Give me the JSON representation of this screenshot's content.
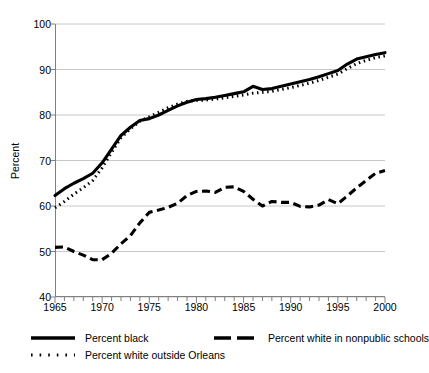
{
  "chart_data": {
    "type": "line",
    "title": "",
    "xlabel": "",
    "ylabel": "Percent",
    "xlim": [
      1965,
      2000
    ],
    "ylim": [
      40,
      100
    ],
    "ytick_labels": [
      "100",
      "90",
      "80",
      "70",
      "60",
      "50",
      "40"
    ],
    "ytick_values": [
      100,
      90,
      80,
      70,
      60,
      50,
      40
    ],
    "xtick_labels": [
      "1965",
      "1970",
      "1975",
      "1980",
      "1985",
      "1990",
      "1995",
      "2000"
    ],
    "xtick_values": [
      1965,
      1970,
      1975,
      1980,
      1985,
      1990,
      1995,
      2000
    ],
    "minor_xticks": "every 1 year",
    "grid": "horizontal gridlines only",
    "legend_position": "below plot, two columns",
    "x": [
      1965,
      1966,
      1967,
      1968,
      1969,
      1970,
      1971,
      1972,
      1973,
      1974,
      1975,
      1976,
      1977,
      1978,
      1979,
      1980,
      1981,
      1982,
      1983,
      1984,
      1985,
      1986,
      1987,
      1988,
      1989,
      1990,
      1991,
      1992,
      1993,
      1994,
      1995,
      1996,
      1997,
      1998,
      1999,
      2000
    ],
    "series": [
      {
        "name": "Percent black",
        "style": "solid",
        "color": "#000000",
        "values": [
          62.3,
          63.8,
          65.0,
          66.0,
          67.2,
          69.5,
          72.5,
          75.5,
          77.3,
          78.8,
          79.2,
          80.0,
          81.0,
          82.0,
          82.8,
          83.4,
          83.6,
          83.9,
          84.3,
          84.7,
          85.1,
          86.3,
          85.6,
          85.8,
          86.3,
          86.8,
          87.3,
          87.8,
          88.4,
          89.1,
          89.8,
          91.2,
          92.3,
          92.8,
          93.3,
          93.7
        ]
      },
      {
        "name": "Percent white outside Orleans",
        "style": "dotted",
        "color": "#000000",
        "values": [
          59.6,
          61.0,
          62.6,
          64.0,
          65.6,
          68.4,
          71.8,
          75.0,
          77.0,
          78.6,
          79.6,
          80.6,
          81.6,
          82.4,
          83.0,
          83.2,
          83.3,
          83.5,
          83.8,
          84.1,
          84.4,
          84.8,
          85.0,
          85.2,
          85.6,
          86.0,
          86.5,
          87.0,
          87.6,
          88.3,
          89.0,
          90.2,
          91.3,
          92.0,
          92.6,
          93.0
        ]
      },
      {
        "name": "Percent white in nonpublic schools",
        "style": "dashed",
        "color": "#000000",
        "values": [
          50.9,
          51.0,
          50.0,
          49.2,
          48.2,
          48.2,
          49.6,
          51.7,
          53.5,
          56.3,
          58.6,
          59.1,
          59.7,
          60.6,
          62.3,
          63.2,
          63.3,
          63.0,
          64.1,
          64.2,
          63.2,
          61.5,
          60.0,
          61.0,
          60.8,
          60.8,
          59.9,
          59.8,
          60.2,
          61.4,
          60.5,
          62.2,
          64.0,
          65.6,
          67.2,
          67.8
        ]
      }
    ]
  },
  "legend": {
    "entries": [
      {
        "label": "Percent black",
        "style": "solid"
      },
      {
        "label": "Percent white outside Orleans",
        "style": "dotted"
      },
      {
        "label": "Percent white in nonpublic schools",
        "style": "dashed"
      }
    ]
  },
  "colors": {
    "line": "#000000",
    "grid": "#c8c8c8",
    "axis": "#808080",
    "background": "#ffffff"
  }
}
